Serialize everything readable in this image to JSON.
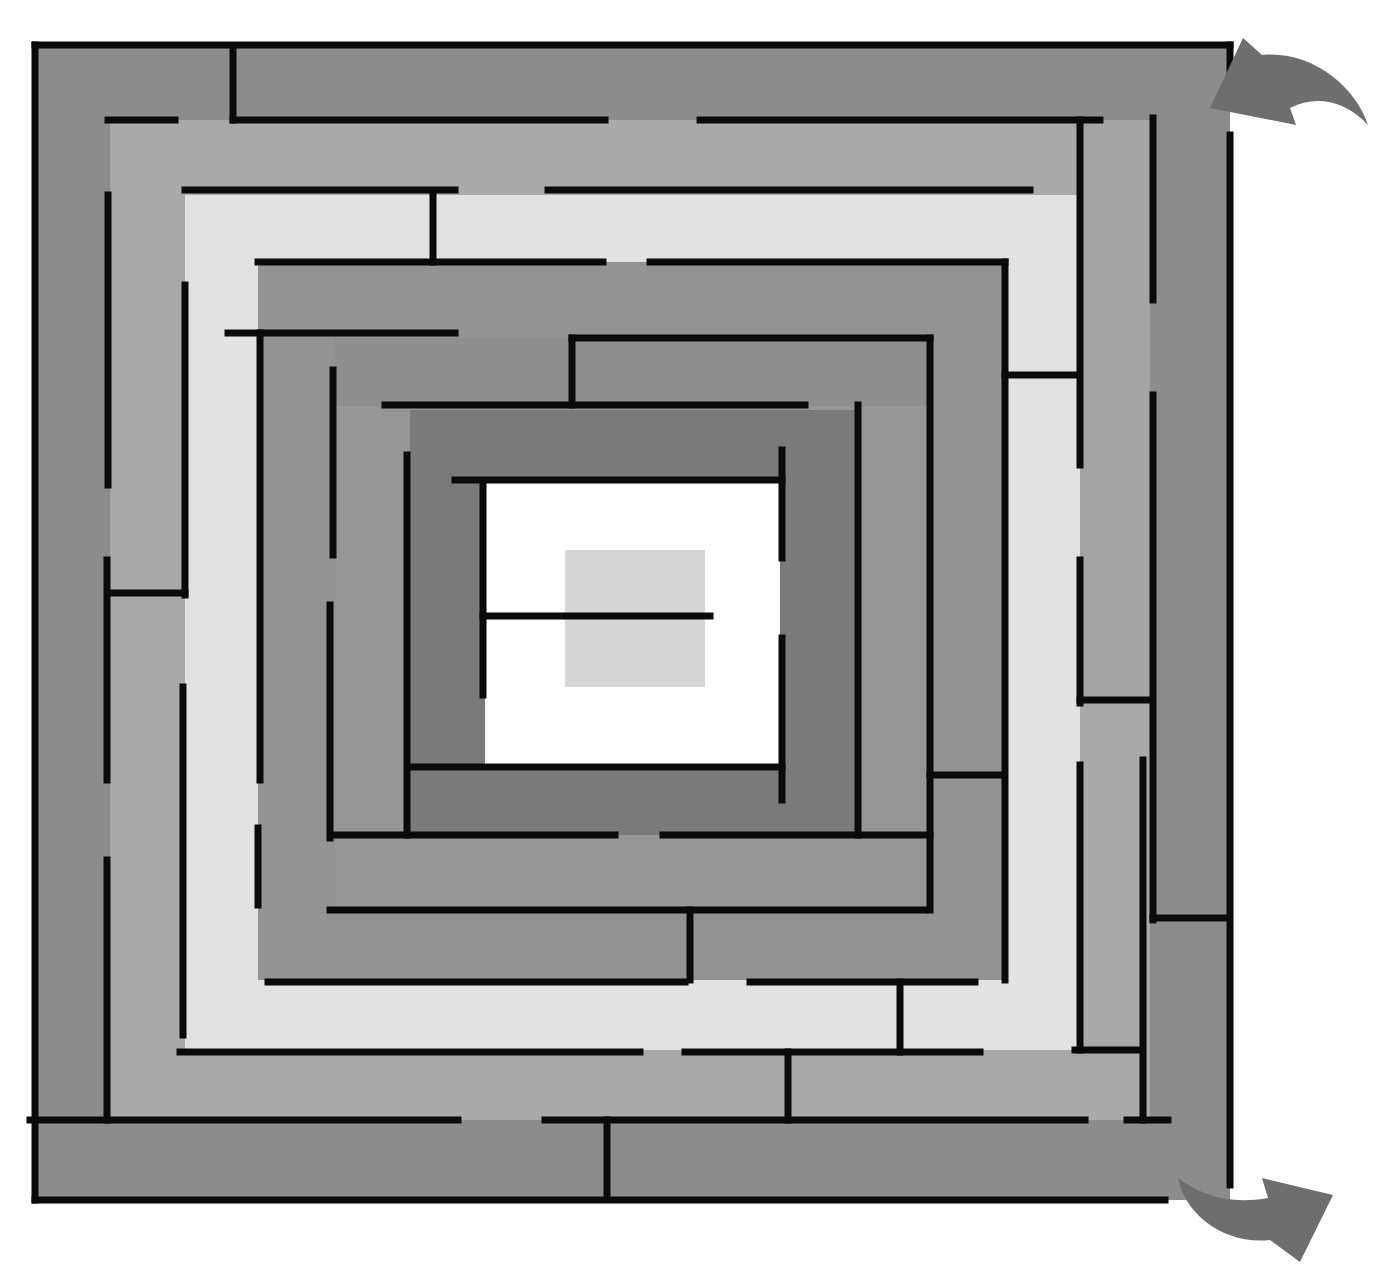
{
  "diagram": {
    "type": "maze",
    "canvas": {
      "width": 1384,
      "height": 1272,
      "background": "#ffffff"
    },
    "wall_color": "#0a0a0a",
    "wall_width": 7,
    "arrow_color": "#6e6e6e",
    "bands": [
      {
        "name": "ring-0",
        "x": 35,
        "y": 45,
        "w": 1195,
        "h": 1155,
        "fill": "#8c8c8c"
      },
      {
        "name": "ring-1",
        "x": 110,
        "y": 120,
        "w": 1040,
        "h": 1000,
        "fill": "#a9a9a9"
      },
      {
        "name": "ring-1-right-strip",
        "x": 1080,
        "y": 120,
        "w": 70,
        "h": 580,
        "fill": "#a4a4a4"
      },
      {
        "name": "ring-2",
        "x": 185,
        "y": 195,
        "w": 895,
        "h": 855,
        "fill": "#e2e2e2"
      },
      {
        "name": "ring-3",
        "x": 258,
        "y": 262,
        "w": 750,
        "h": 718,
        "fill": "#939393"
      },
      {
        "name": "ring-3-right-light",
        "x": 1005,
        "y": 375,
        "w": 75,
        "h": 600,
        "fill": "#e2e2e2"
      },
      {
        "name": "ring-4",
        "x": 335,
        "y": 338,
        "w": 595,
        "h": 572,
        "fill": "#969696"
      },
      {
        "name": "ring-4-top-dark",
        "x": 335,
        "y": 338,
        "w": 595,
        "h": 68,
        "fill": "#8e8e8e"
      },
      {
        "name": "ring-5",
        "x": 410,
        "y": 410,
        "w": 448,
        "h": 425,
        "fill": "#7a7a7a"
      },
      {
        "name": "ring-6",
        "x": 485,
        "y": 482,
        "w": 295,
        "h": 283,
        "fill": "#ffffff"
      },
      {
        "name": "center",
        "x": 565,
        "y": 550,
        "w": 140,
        "h": 137,
        "fill": "#d6d6d6"
      }
    ],
    "walls": [
      {
        "x1": 35,
        "y1": 45,
        "x2": 1230,
        "y2": 45
      },
      {
        "x1": 35,
        "y1": 45,
        "x2": 35,
        "y2": 1200
      },
      {
        "x1": 35,
        "y1": 1200,
        "x2": 1165,
        "y2": 1200
      },
      {
        "x1": 1230,
        "y1": 45,
        "x2": 1230,
        "y2": 70
      },
      {
        "x1": 1230,
        "y1": 135,
        "x2": 1230,
        "y2": 1185
      },
      {
        "x1": 233,
        "y1": 50,
        "x2": 233,
        "y2": 120
      },
      {
        "x1": 108,
        "y1": 120,
        "x2": 175,
        "y2": 120
      },
      {
        "x1": 233,
        "y1": 120,
        "x2": 605,
        "y2": 120
      },
      {
        "x1": 700,
        "y1": 120,
        "x2": 1100,
        "y2": 120
      },
      {
        "x1": 1153,
        "y1": 118,
        "x2": 1153,
        "y2": 300
      },
      {
        "x1": 1153,
        "y1": 395,
        "x2": 1153,
        "y2": 920
      },
      {
        "x1": 1153,
        "y1": 918,
        "x2": 1228,
        "y2": 918
      },
      {
        "x1": 108,
        "y1": 195,
        "x2": 108,
        "y2": 485
      },
      {
        "x1": 107,
        "y1": 560,
        "x2": 107,
        "y2": 780
      },
      {
        "x1": 107,
        "y1": 860,
        "x2": 107,
        "y2": 1120
      },
      {
        "x1": 30,
        "y1": 1120,
        "x2": 458,
        "y2": 1120
      },
      {
        "x1": 545,
        "y1": 1120,
        "x2": 1085,
        "y2": 1120
      },
      {
        "x1": 1127,
        "y1": 1120,
        "x2": 1168,
        "y2": 1120
      },
      {
        "x1": 607,
        "y1": 1120,
        "x2": 607,
        "y2": 1198
      },
      {
        "x1": 185,
        "y1": 190,
        "x2": 455,
        "y2": 190
      },
      {
        "x1": 433,
        "y1": 192,
        "x2": 433,
        "y2": 262
      },
      {
        "x1": 548,
        "y1": 190,
        "x2": 1030,
        "y2": 190
      },
      {
        "x1": 1080,
        "y1": 120,
        "x2": 1080,
        "y2": 465
      },
      {
        "x1": 1080,
        "y1": 560,
        "x2": 1080,
        "y2": 703
      },
      {
        "x1": 1080,
        "y1": 700,
        "x2": 1148,
        "y2": 700
      },
      {
        "x1": 1080,
        "y1": 765,
        "x2": 1080,
        "y2": 1050
      },
      {
        "x1": 108,
        "y1": 593,
        "x2": 185,
        "y2": 593
      },
      {
        "x1": 185,
        "y1": 285,
        "x2": 185,
        "y2": 595
      },
      {
        "x1": 183,
        "y1": 687,
        "x2": 183,
        "y2": 1035
      },
      {
        "x1": 180,
        "y1": 1052,
        "x2": 640,
        "y2": 1052
      },
      {
        "x1": 685,
        "y1": 1052,
        "x2": 980,
        "y2": 1052
      },
      {
        "x1": 1075,
        "y1": 1050,
        "x2": 1140,
        "y2": 1050
      },
      {
        "x1": 788,
        "y1": 1052,
        "x2": 788,
        "y2": 1120
      },
      {
        "x1": 1143,
        "y1": 760,
        "x2": 1143,
        "y2": 1120
      },
      {
        "x1": 258,
        "y1": 262,
        "x2": 603,
        "y2": 262
      },
      {
        "x1": 650,
        "y1": 262,
        "x2": 1005,
        "y2": 262
      },
      {
        "x1": 1005,
        "y1": 262,
        "x2": 1005,
        "y2": 980
      },
      {
        "x1": 1005,
        "y1": 375,
        "x2": 1077,
        "y2": 375
      },
      {
        "x1": 228,
        "y1": 333,
        "x2": 455,
        "y2": 333
      },
      {
        "x1": 260,
        "y1": 333,
        "x2": 260,
        "y2": 780
      },
      {
        "x1": 258,
        "y1": 828,
        "x2": 258,
        "y2": 905
      },
      {
        "x1": 330,
        "y1": 605,
        "x2": 330,
        "y2": 838
      },
      {
        "x1": 268,
        "y1": 982,
        "x2": 685,
        "y2": 982
      },
      {
        "x1": 750,
        "y1": 982,
        "x2": 975,
        "y2": 982
      },
      {
        "x1": 900,
        "y1": 982,
        "x2": 900,
        "y2": 1052
      },
      {
        "x1": 333,
        "y1": 370,
        "x2": 333,
        "y2": 555
      },
      {
        "x1": 572,
        "y1": 338,
        "x2": 572,
        "y2": 405
      },
      {
        "x1": 572,
        "y1": 338,
        "x2": 930,
        "y2": 338
      },
      {
        "x1": 930,
        "y1": 338,
        "x2": 930,
        "y2": 910
      },
      {
        "x1": 930,
        "y1": 775,
        "x2": 1003,
        "y2": 775
      },
      {
        "x1": 385,
        "y1": 405,
        "x2": 805,
        "y2": 405
      },
      {
        "x1": 330,
        "y1": 910,
        "x2": 925,
        "y2": 910
      },
      {
        "x1": 690,
        "y1": 910,
        "x2": 690,
        "y2": 980
      },
      {
        "x1": 333,
        "y1": 835,
        "x2": 615,
        "y2": 835
      },
      {
        "x1": 663,
        "y1": 835,
        "x2": 930,
        "y2": 835
      },
      {
        "x1": 407,
        "y1": 455,
        "x2": 407,
        "y2": 835
      },
      {
        "x1": 858,
        "y1": 405,
        "x2": 858,
        "y2": 835
      },
      {
        "x1": 410,
        "y1": 767,
        "x2": 782,
        "y2": 767
      },
      {
        "x1": 782,
        "y1": 450,
        "x2": 782,
        "y2": 558
      },
      {
        "x1": 782,
        "y1": 638,
        "x2": 782,
        "y2": 800
      },
      {
        "x1": 455,
        "y1": 480,
        "x2": 782,
        "y2": 480
      },
      {
        "x1": 483,
        "y1": 482,
        "x2": 483,
        "y2": 695
      },
      {
        "x1": 483,
        "y1": 616,
        "x2": 710,
        "y2": 616
      }
    ],
    "arrows": [
      {
        "name": "entrance-arrow",
        "position": "top-right",
        "direction": "into-maze"
      },
      {
        "name": "exit-arrow",
        "position": "bottom-right",
        "direction": "out-of-maze"
      }
    ]
  }
}
